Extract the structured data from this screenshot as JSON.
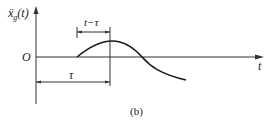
{
  "figure": {
    "y_axis_label": "ẍ",
    "y_axis_label_sub": "g",
    "y_axis_label_arg": "(t)",
    "origin_label": "O",
    "x_axis_label": "t",
    "interval_upper_label": "t−τ",
    "interval_lower_label": "τ",
    "caption": "(b)"
  },
  "colors": {
    "stroke": "#333333",
    "curve": "#1a1a1a",
    "background": "#ffffff"
  }
}
